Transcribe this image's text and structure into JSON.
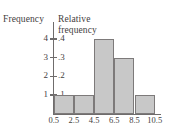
{
  "figure": {
    "left_axis_title": "Frequency",
    "right_axis_title": "Relative\nfrequency"
  },
  "chart_data": {
    "type": "bar",
    "title": "",
    "subtitle": "",
    "xlabel": "",
    "ylabel": "Frequency",
    "y2label": "Relative frequency",
    "grid": false,
    "legend": null,
    "bin_edges": [
      0.5,
      2.5,
      4.5,
      6.5,
      8.5,
      10.5
    ],
    "categories": [
      "0.5-2.5",
      "2.5-4.5",
      "4.5-6.5",
      "6.5-8.5",
      "8.5-10.5"
    ],
    "values": [
      1,
      1,
      4,
      3,
      1
    ],
    "relative_values": [
      0.1,
      0.1,
      0.4,
      0.3,
      0.1
    ],
    "ylim": [
      0,
      4.4
    ],
    "y2lim": [
      0,
      0.44
    ],
    "xlim": [
      0.5,
      10.5
    ],
    "x_tick_labels": [
      "0.5",
      "2.5",
      "4.5",
      "6.5",
      "8.5",
      "10.5"
    ],
    "y_tick_values": [
      1,
      2,
      3,
      4
    ],
    "y_tick_labels": [
      "1",
      "2",
      "3",
      "4"
    ],
    "y2_tick_labels": [
      ".1",
      ".2",
      ".3",
      ".4"
    ],
    "bar_fill_color": "#c8c8c8",
    "bar_edge_color": "#7d7a7a",
    "axis_color": "#6f6c6c",
    "background_color": "#ffffff"
  }
}
